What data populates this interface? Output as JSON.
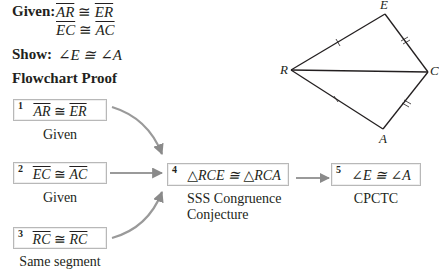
{
  "given": {
    "label": "Given:",
    "lines": [
      {
        "left": "AR",
        "rel": "≅",
        "right": "ER"
      },
      {
        "left": "EC",
        "rel": "≅",
        "right": "AC"
      }
    ]
  },
  "show": {
    "label": "Show:",
    "statement": "∠E ≅ ∠A"
  },
  "proof_title": "Flowchart Proof",
  "steps": [
    {
      "num": "1",
      "left": "AR",
      "rel": "≅",
      "right": "ER",
      "reason": "Given"
    },
    {
      "num": "2",
      "left": "EC",
      "rel": "≅",
      "right": "AC",
      "reason": "Given"
    },
    {
      "num": "3",
      "left": "RC",
      "rel": "≅",
      "right": "RC",
      "reason": "Same segment"
    },
    {
      "num": "4",
      "statement": "△RCE ≅ △RCA",
      "reason_line1": "SSS Congruence",
      "reason_line2": "Conjecture"
    },
    {
      "num": "5",
      "statement": "∠E ≅ ∠A",
      "reason": "CPCTC"
    }
  ],
  "figure": {
    "vertices": {
      "R": "R",
      "E": "E",
      "C": "C",
      "A": "A"
    },
    "line_color": "#231f20",
    "arrow_color": "#8a8a8a"
  }
}
